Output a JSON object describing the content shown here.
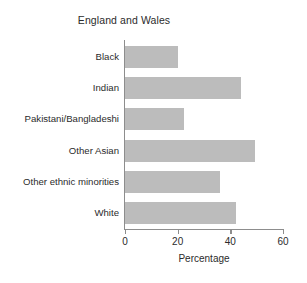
{
  "chart_data": {
    "type": "bar",
    "orientation": "horizontal",
    "title": "England and Wales",
    "xlabel": "Percentage",
    "ylabel": "",
    "xlim": [
      0,
      60
    ],
    "xticks": [
      0,
      20,
      40,
      60
    ],
    "xtick_labels": [
      "0",
      "20",
      "40",
      "60"
    ],
    "grid": false,
    "legend": false,
    "bar_color": "#bcbcbc",
    "axis_color": "#8d8d8d",
    "background": "#ffffff",
    "categories": [
      "Black",
      "Indian",
      "Pakistani/Bangladeshi",
      "Other Asian",
      "Other ethnic minorities",
      "White"
    ],
    "values": [
      20,
      44,
      22.5,
      49.5,
      36,
      42
    ]
  }
}
